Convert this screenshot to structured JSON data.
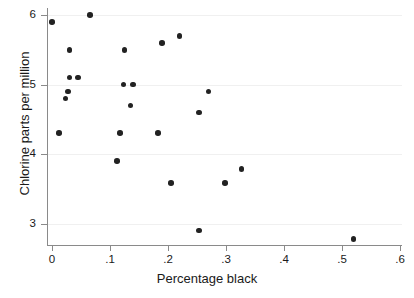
{
  "chart_data": {
    "type": "scatter",
    "title": "",
    "xlabel": "Percentage black",
    "ylabel": "Chlorine parts per million",
    "xlim": [
      0,
      0.6
    ],
    "ylim": [
      2.72,
      6.1
    ],
    "xticks": [
      "0",
      ".1",
      ".2",
      ".3",
      ".4",
      ".5",
      ".6"
    ],
    "xtick_values": [
      0,
      0.1,
      0.2,
      0.3,
      0.4,
      0.5,
      0.6
    ],
    "yticks": [
      "3",
      "4",
      "5",
      "6"
    ],
    "ytick_values": [
      3,
      4,
      5,
      6
    ],
    "grid": "horizontal",
    "legend": "none",
    "marker_color": "#222222",
    "grid_color": "#f0f0f0",
    "axis_color": "#8a8a8a",
    "points": [
      {
        "x": 0.0,
        "y": 5.9
      },
      {
        "x": 0.066,
        "y": 6.0
      },
      {
        "x": 0.03,
        "y": 5.5
      },
      {
        "x": 0.125,
        "y": 5.5
      },
      {
        "x": 0.19,
        "y": 5.6
      },
      {
        "x": 0.22,
        "y": 5.7
      },
      {
        "x": 0.03,
        "y": 5.1
      },
      {
        "x": 0.045,
        "y": 5.1
      },
      {
        "x": 0.028,
        "y": 4.9
      },
      {
        "x": 0.023,
        "y": 4.8
      },
      {
        "x": 0.123,
        "y": 5.0
      },
      {
        "x": 0.14,
        "y": 5.0
      },
      {
        "x": 0.135,
        "y": 4.7
      },
      {
        "x": 0.27,
        "y": 4.9
      },
      {
        "x": 0.253,
        "y": 4.6
      },
      {
        "x": 0.012,
        "y": 4.3
      },
      {
        "x": 0.117,
        "y": 4.3
      },
      {
        "x": 0.183,
        "y": 4.3
      },
      {
        "x": 0.112,
        "y": 3.9
      },
      {
        "x": 0.327,
        "y": 3.78
      },
      {
        "x": 0.205,
        "y": 3.58
      },
      {
        "x": 0.298,
        "y": 3.58
      },
      {
        "x": 0.253,
        "y": 2.9
      },
      {
        "x": 0.52,
        "y": 2.78
      }
    ]
  }
}
